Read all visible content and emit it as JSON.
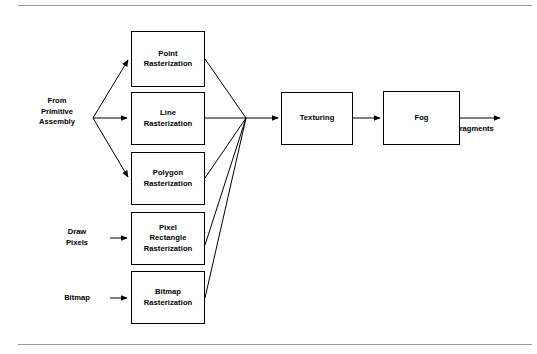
{
  "figure": {
    "background_color": "#ffffff",
    "line_color": "#000000",
    "rule_color": "#9a9a9a"
  },
  "labels": {
    "from_primitive_assembly": "From\nPrimitive\nAssembly",
    "draw_pixels": "Draw\nPixels",
    "bitmap": "Bitmap",
    "fragments": "Fragments"
  },
  "nodes": {
    "point_rasterization": "Point\nRasterization",
    "line_rasterization": "Line\nRasterization",
    "polygon_rasterization": "Polygon\nRasterization",
    "pixel_rectangle_rasterization": "Pixel\nRectangle\nRasterization",
    "bitmap_rasterization": "Bitmap\nRasterization",
    "texturing": "Texturing",
    "fog": "Fog"
  },
  "flow": {
    "inputs": [
      "From Primitive Assembly",
      "Draw Pixels",
      "Bitmap"
    ],
    "stages": [
      "Point Rasterization",
      "Line Rasterization",
      "Polygon Rasterization",
      "Pixel Rectangle Rasterization",
      "Bitmap Rasterization",
      "Texturing",
      "Fog"
    ],
    "output": "Fragments"
  }
}
